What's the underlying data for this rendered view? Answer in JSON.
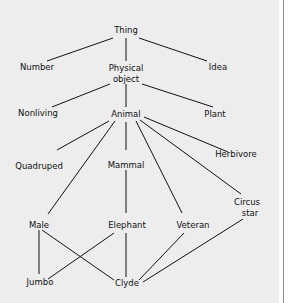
{
  "diagram": {
    "type": "semantic-network",
    "nodes": {
      "thing": "Thing",
      "number": "Number",
      "physical_object_1": "Physical",
      "physical_object_2": "object",
      "idea": "Idea",
      "nonliving": "Nonliving",
      "animal": "Animal",
      "plant": "Plant",
      "quadruped": "Quadruped",
      "mammal": "Mammal",
      "herbivore": "Herbivore",
      "circus_star_1": "Circus",
      "circus_star_2": "star",
      "male": "Male",
      "elephant": "Elephant",
      "veteran": "Veteran",
      "jumbo": "Jumbo",
      "clyde": "Clyde"
    },
    "edges": [
      [
        "Thing",
        "Number"
      ],
      [
        "Thing",
        "Physical object"
      ],
      [
        "Thing",
        "Idea"
      ],
      [
        "Physical object",
        "Nonliving"
      ],
      [
        "Physical object",
        "Animal"
      ],
      [
        "Physical object",
        "Plant"
      ],
      [
        "Animal",
        "Quadruped"
      ],
      [
        "Animal",
        "Male"
      ],
      [
        "Animal",
        "Mammal"
      ],
      [
        "Animal",
        "Veteran"
      ],
      [
        "Animal",
        "Circus star"
      ],
      [
        "Animal",
        "Herbivore"
      ],
      [
        "Mammal",
        "Elephant"
      ],
      [
        "Male",
        "Jumbo"
      ],
      [
        "Male",
        "Clyde"
      ],
      [
        "Elephant",
        "Jumbo"
      ],
      [
        "Elephant",
        "Clyde"
      ],
      [
        "Veteran",
        "Clyde"
      ],
      [
        "Circus star",
        "Clyde"
      ]
    ]
  }
}
